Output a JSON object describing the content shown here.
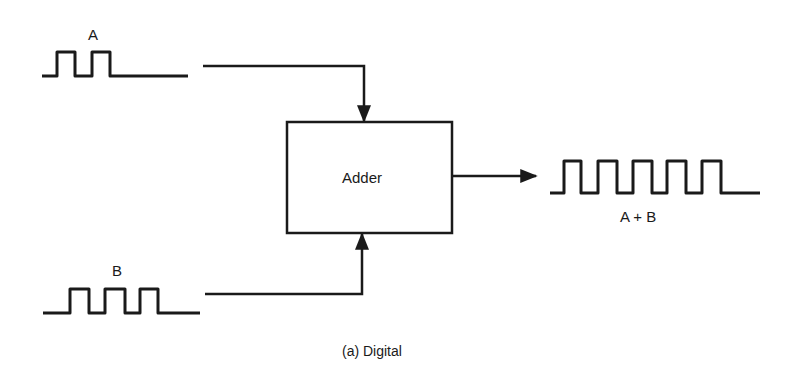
{
  "diagram": {
    "inputs": [
      {
        "label": "A",
        "pulses": 2
      },
      {
        "label": "B",
        "pulses": 3
      }
    ],
    "block": {
      "label": "Adder"
    },
    "output": {
      "label": "A + B",
      "pulses": 5
    },
    "caption": "(a) Digital"
  },
  "colors": {
    "stroke": "#1a1a1a",
    "background": "#ffffff"
  }
}
